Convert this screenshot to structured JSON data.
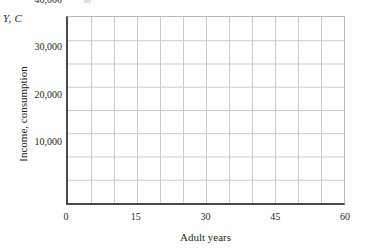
{
  "chart_data": {
    "type": "line",
    "title": "",
    "subtitle": "",
    "series": [],
    "annotations": [],
    "axis_variable_label": "Y, C",
    "xlabel": "Adult years",
    "ylabel": "Income, consumption",
    "xlim": [
      0,
      60
    ],
    "ylim": [
      0,
      40000
    ],
    "xticks": [
      0,
      15,
      30,
      45,
      60
    ],
    "xtick_labels": [
      "0",
      "15",
      "30",
      "45",
      "60"
    ],
    "yticks": [
      10000,
      20000,
      30000,
      40000
    ],
    "ytick_labels": [
      "10,000",
      "20,000",
      "30,000",
      "40,000"
    ],
    "x_gridline_step": 5,
    "y_gridline_step": 5000,
    "grid": true,
    "legend": false,
    "legend_position": "none",
    "colors": {
      "gridline": "#c9c9c9",
      "axis": "#4a4a4a",
      "border": "#b9b9b9",
      "text": "#231f20",
      "background": "#ffffff"
    },
    "note": "empty plotting grid, no data series drawn"
  }
}
